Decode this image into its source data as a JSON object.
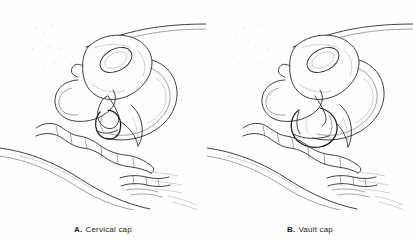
{
  "figure": {
    "background_color": "#fefefe",
    "line_color": "#2b2b2b",
    "panel_count": 2
  },
  "panels": [
    {
      "id": "a",
      "label": "A.",
      "caption": "Cervical cap",
      "device": "cervical cap",
      "description": "Midsagittal section of female pelvis showing a cervical cap fitted over the cervix"
    },
    {
      "id": "b",
      "label": "B.",
      "caption": "Vault cap",
      "device": "vault cap",
      "description": "Midsagittal section of female pelvis showing a vault cap seated in the vaginal vault"
    }
  ],
  "structures": [
    "uterus",
    "uterine cavity",
    "cervix",
    "bladder",
    "vagina",
    "rectum",
    "symphysis pubis",
    "sacrum"
  ]
}
